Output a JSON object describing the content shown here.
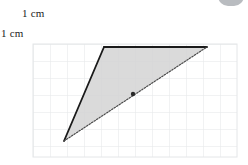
{
  "canvas": {
    "width": 248,
    "height": 165,
    "background": "#ffffff"
  },
  "labels": {
    "horizontal_unit": "1 cm",
    "vertical_unit": "1 cm"
  },
  "grid": {
    "left": 33,
    "top": 44,
    "right": 237,
    "bottom": 157,
    "cell_size": 17,
    "columns": 12,
    "rows": 7,
    "line_color": "#e4e6e8",
    "visible": true
  },
  "figure": {
    "type": "triangle",
    "fill_color": "#d4d4d4",
    "vertices": [
      {
        "name": "apex-top-left",
        "x": 104,
        "y": 47
      },
      {
        "name": "apex-top-right",
        "x": 207,
        "y": 47
      },
      {
        "name": "apex-bottom-left",
        "x": 64,
        "y": 141
      }
    ],
    "edges": [
      {
        "name": "top-edge",
        "from": "apex-top-left",
        "to": "apex-top-right",
        "style": "solid",
        "color": "#1a1a1a",
        "width": 1.8
      },
      {
        "name": "left-edge",
        "from": "apex-top-left",
        "to": "apex-bottom-left",
        "style": "solid",
        "color": "#1a1a1a",
        "width": 1.8
      },
      {
        "name": "hypotenuse",
        "from": "apex-bottom-left",
        "to": "apex-top-right",
        "style": "dotted",
        "color": "#4a4a4a",
        "width": 1.2
      }
    ],
    "markers": [
      {
        "name": "midpoint-dot",
        "x": 133,
        "y": 94,
        "radius": 2.2,
        "color": "#2a2a2a"
      }
    ]
  },
  "decoration": {
    "corner_blob_color": "#b9bcc0"
  }
}
